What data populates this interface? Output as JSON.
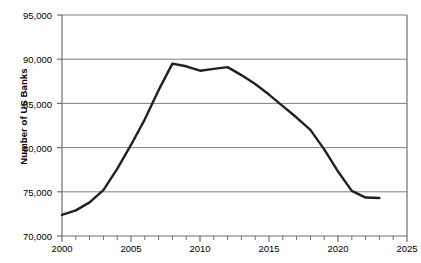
{
  "chart_data": {
    "type": "line",
    "title": "",
    "xlabel": "",
    "ylabel": "Number of US Banks",
    "xlim": [
      2000,
      2025
    ],
    "ylim": [
      70000,
      95000
    ],
    "grid": true,
    "legend": "none",
    "x_ticks": [
      2000,
      2005,
      2010,
      2015,
      2020,
      2025
    ],
    "x_tick_labels": [
      "2000",
      "2005",
      "2010",
      "2015",
      "2020",
      "2025"
    ],
    "x_minor_tick_step": 1,
    "y_ticks": [
      70000,
      75000,
      80000,
      85000,
      90000,
      95000
    ],
    "y_tick_labels": [
      "70,000",
      "75,000",
      "80,000",
      "85,000",
      "90,000",
      "95,000"
    ],
    "line_color": "#231f20",
    "grid_color": "#808080",
    "axis_color": "#6e6e6e",
    "series": [
      {
        "name": "Number of US Banks",
        "x": [
          2000,
          2001,
          2002,
          2003,
          2004,
          2005,
          2006,
          2007,
          2008,
          2009,
          2010,
          2011,
          2012,
          2013,
          2014,
          2015,
          2016,
          2017,
          2018,
          2019,
          2020,
          2021,
          2022,
          2023
        ],
        "values": [
          72400,
          72900,
          73800,
          75200,
          77600,
          80300,
          83200,
          86500,
          89500,
          89200,
          88700,
          88900,
          89100,
          88200,
          87200,
          86000,
          84700,
          83400,
          82000,
          79800,
          77300,
          75100,
          74350,
          74300
        ]
      }
    ]
  },
  "axis": {
    "y_title": "Number of US Banks"
  }
}
